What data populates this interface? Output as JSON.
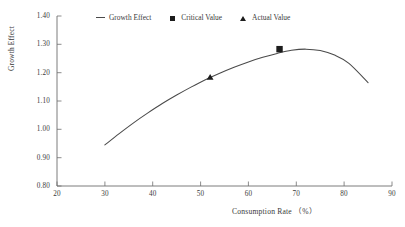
{
  "chart_data": {
    "type": "line",
    "title": "",
    "xlabel": "Consumption Rate （%）",
    "ylabel": "Growth Effect",
    "xlim": [
      20,
      90
    ],
    "ylim": [
      0.8,
      1.4
    ],
    "xticks": [
      "20",
      "30",
      "40",
      "50",
      "60",
      "70",
      "80",
      "90"
    ],
    "yticks": [
      "1.40",
      "1.30",
      "1.20",
      "1.10",
      "1.00",
      "0.90",
      "0.80"
    ],
    "grid": false,
    "legend_position": "top-center",
    "series": [
      {
        "name": "Growth Effect",
        "marker": "line",
        "color": "#4a4a4a",
        "x": [
          30,
          33,
          36,
          39,
          42,
          45,
          48,
          51,
          54,
          57,
          60,
          63,
          66,
          69,
          72,
          75,
          78,
          81,
          85
        ],
        "values": [
          0.945,
          0.985,
          1.023,
          1.058,
          1.091,
          1.121,
          1.149,
          1.175,
          1.198,
          1.219,
          1.238,
          1.254,
          1.268,
          1.279,
          1.283,
          1.278,
          1.262,
          1.233,
          1.165
        ]
      },
      {
        "name": "Critical Value",
        "marker": "square",
        "color": "#1c1c1c",
        "x": [
          66.5
        ],
        "values": [
          1.283
        ]
      },
      {
        "name": "Actual Value",
        "marker": "triangle",
        "color": "#1c1c1c",
        "x": [
          52.0
        ],
        "values": [
          1.185
        ]
      }
    ]
  },
  "legend": {
    "items": [
      {
        "label": "Growth Effect",
        "glyph": "line-glyph"
      },
      {
        "label": "Critical Value",
        "glyph": "square-glyph"
      },
      {
        "label": "Actual Value",
        "glyph": "triangle-glyph"
      }
    ]
  },
  "axes": {
    "x_label": "Consumption Rate （%）",
    "y_label": "Growth Effect",
    "x_ticks": [
      "20",
      "30",
      "40",
      "50",
      "60",
      "70",
      "80",
      "90"
    ],
    "y_ticks": [
      "1.40",
      "1.30",
      "1.20",
      "1.10",
      "1.00",
      "0.90",
      "0.80"
    ]
  },
  "colors": {
    "curve": "#4a4a4a",
    "marker": "#1c1c1c",
    "axis": "#6e6e6e",
    "text": "#3a3a3a",
    "background": "#ffffff"
  }
}
